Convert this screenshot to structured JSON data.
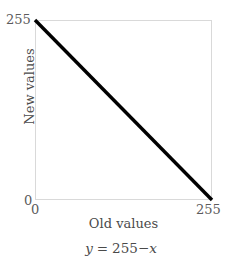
{
  "chart_data": {
    "type": "line",
    "title": "",
    "subtitle": "",
    "xlabel": "Old values",
    "ylabel": "New values",
    "caption": "y = 255−x",
    "equation_parts": {
      "lhs_var": "y",
      "equals": "=",
      "constant": "255",
      "minus": "−",
      "rhs_var": "x"
    },
    "xlim": [
      0,
      255
    ],
    "ylim": [
      0,
      255
    ],
    "xticks": [
      "0",
      "255"
    ],
    "yticks": [
      "0",
      "255"
    ],
    "grid": false,
    "legend": null,
    "x": [
      0,
      255
    ],
    "series": [
      {
        "name": "y = 255 - x",
        "values": [
          255,
          0
        ],
        "color": "#000000",
        "linewidth": 3
      }
    ],
    "colors": {
      "line": "#000000",
      "frame": "#d9d9d9",
      "tick_label": "#5b5b5b",
      "axis_label": "#4a4a4a",
      "background": "#ffffff"
    }
  }
}
